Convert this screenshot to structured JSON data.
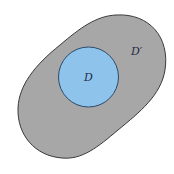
{
  "diagram": {
    "outer_region": {
      "label": "D′",
      "fill": "#a7a7a7",
      "stroke": "#3a3a3a"
    },
    "inner_region": {
      "label": "D",
      "fill": "#8ec3ec",
      "stroke": "#2e4a6a"
    }
  }
}
